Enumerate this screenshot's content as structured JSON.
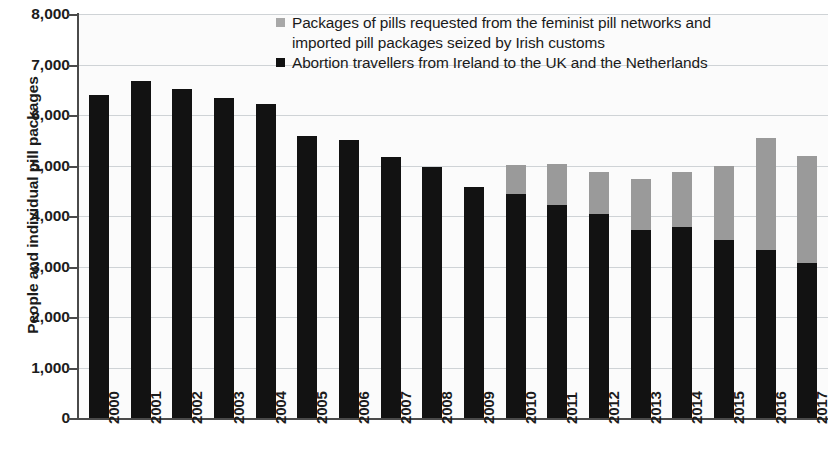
{
  "chart_data": {
    "type": "bar",
    "subtype": "stacked-vertical-bar",
    "title": "",
    "xlabel": "",
    "ylabel": "People and individual pill packages",
    "ylim": [
      0,
      8000
    ],
    "ytick_step": 1000,
    "ytick_labels": [
      "8,000",
      "7,000",
      "6,000",
      "5,000",
      "4,000",
      "3,000",
      "2,000",
      "1,000",
      "0"
    ],
    "ytick_values": [
      8000,
      7000,
      6000,
      5000,
      4000,
      3000,
      2000,
      1000,
      0
    ],
    "grid": true,
    "legend_position": "top-right-inside",
    "categories": [
      "2000",
      "2001",
      "2002",
      "2003",
      "2004",
      "2005",
      "2006",
      "2007",
      "2008",
      "2009",
      "2010",
      "2011",
      "2012",
      "2013",
      "2014",
      "2015",
      "2016",
      "2017"
    ],
    "series": [
      {
        "name": "Abortion travellers from Ireland to the UK and the  Netherlands",
        "color": "#121212",
        "stack_order": 0,
        "values": [
          6400,
          6680,
          6520,
          6330,
          6220,
          5590,
          5510,
          5160,
          4970,
          4570,
          4440,
          4210,
          4040,
          3730,
          3790,
          3530,
          3330,
          3060
        ]
      },
      {
        "name": "Packages of pills requested from the feminist pill networks and imported pill packages seized by Irish customs",
        "color": "#9a9a9a",
        "stack_order": 1,
        "values": [
          0,
          0,
          0,
          0,
          0,
          0,
          0,
          0,
          0,
          0,
          580,
          820,
          840,
          1000,
          1090,
          1470,
          2220,
          2120
        ]
      }
    ],
    "totals": [
      6400,
      6680,
      6520,
      6330,
      6220,
      5590,
      5510,
      5160,
      4970,
      4570,
      5020,
      5030,
      4880,
      4730,
      4880,
      5000,
      5550,
      5180
    ]
  },
  "legend": {
    "items": [
      {
        "marker": "gray-square-marker",
        "line1": "Packages of pills requested from the feminist pill networks and",
        "line2": "imported pill packages seized by Irish customs"
      },
      {
        "marker": "black-square-marker",
        "line1": "Abortion travellers from Ireland to the UK and the  Netherlands",
        "line2": ""
      }
    ]
  },
  "colors": {
    "black_series": "#121212",
    "gray_series": "#9a9a9a",
    "gridline": "#cfd3d6",
    "axis": "#4a4a4a",
    "plot_background": "#fbfbfb",
    "text": "#1c1c1c"
  }
}
